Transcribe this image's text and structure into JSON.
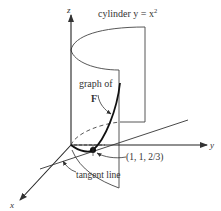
{
  "diagram": {
    "axes": {
      "z_label": "z",
      "y_label": "y",
      "x_label": "x"
    },
    "labels": {
      "cylinder": "cylinder y = x",
      "cylinder_exponent": "2",
      "graph_of": "graph of",
      "F": "F",
      "point": "(1, 1, 2/3)",
      "tangent_line": "tangent line"
    },
    "colors": {
      "stroke": "#333333",
      "text": "#333333",
      "background": "#ffffff"
    }
  }
}
